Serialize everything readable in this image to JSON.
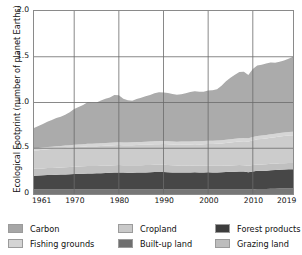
{
  "chart_data": {
    "type": "area",
    "stacked": true,
    "title": "",
    "subtitle": "",
    "xlabel": "",
    "ylabel": "Ecological Footprint (number of planet Earths)",
    "xlim": [
      1961,
      2019
    ],
    "ylim": [
      0,
      2.0
    ],
    "grid": true,
    "legend_position": "bottom",
    "xticks": [
      "1961",
      "1970",
      "1980",
      "1990",
      "2000",
      "2010",
      "2019"
    ],
    "xtick_values": [
      1961,
      1970,
      1980,
      1990,
      2000,
      2010,
      2019
    ],
    "yticks": [
      "0",
      "0.5",
      "1.0",
      "1.5",
      "2.0"
    ],
    "ytick_values": [
      0,
      0.5,
      1.0,
      1.5,
      2.0
    ],
    "x": [
      1961,
      1962,
      1963,
      1964,
      1965,
      1966,
      1967,
      1968,
      1969,
      1970,
      1971,
      1972,
      1973,
      1974,
      1975,
      1976,
      1977,
      1978,
      1979,
      1980,
      1981,
      1982,
      1983,
      1984,
      1985,
      1986,
      1987,
      1988,
      1989,
      1990,
      1991,
      1992,
      1993,
      1994,
      1995,
      1996,
      1997,
      1998,
      1999,
      2000,
      2001,
      2002,
      2003,
      2004,
      2005,
      2006,
      2007,
      2008,
      2009,
      2010,
      2011,
      2012,
      2013,
      2014,
      2015,
      2016,
      2017,
      2018,
      2019
    ],
    "series": [
      {
        "name": "Built-up land",
        "color": "#6f6f6f",
        "values": [
          0.05,
          0.05,
          0.05,
          0.05,
          0.05,
          0.05,
          0.05,
          0.05,
          0.05,
          0.05,
          0.05,
          0.05,
          0.05,
          0.05,
          0.05,
          0.05,
          0.05,
          0.05,
          0.05,
          0.05,
          0.05,
          0.05,
          0.05,
          0.05,
          0.05,
          0.05,
          0.05,
          0.05,
          0.05,
          0.05,
          0.05,
          0.05,
          0.05,
          0.05,
          0.05,
          0.05,
          0.05,
          0.05,
          0.05,
          0.05,
          0.05,
          0.05,
          0.05,
          0.05,
          0.05,
          0.05,
          0.05,
          0.05,
          0.05,
          0.05,
          0.055,
          0.055,
          0.055,
          0.058,
          0.058,
          0.06,
          0.06,
          0.06,
          0.06
        ]
      },
      {
        "name": "Forest products",
        "color": "#3d3d3d",
        "values": [
          0.15,
          0.152,
          0.154,
          0.157,
          0.158,
          0.16,
          0.162,
          0.164,
          0.166,
          0.168,
          0.17,
          0.172,
          0.175,
          0.175,
          0.176,
          0.178,
          0.18,
          0.182,
          0.184,
          0.186,
          0.184,
          0.183,
          0.183,
          0.184,
          0.185,
          0.186,
          0.188,
          0.19,
          0.19,
          0.19,
          0.188,
          0.186,
          0.185,
          0.185,
          0.186,
          0.186,
          0.187,
          0.186,
          0.186,
          0.188,
          0.186,
          0.186,
          0.187,
          0.19,
          0.192,
          0.194,
          0.196,
          0.195,
          0.188,
          0.196,
          0.198,
          0.198,
          0.2,
          0.202,
          0.203,
          0.205,
          0.207,
          0.21,
          0.21
        ]
      },
      {
        "name": "Grazing land",
        "color": "#bdbdbd",
        "values": [
          0.075,
          0.075,
          0.076,
          0.076,
          0.077,
          0.077,
          0.078,
          0.078,
          0.079,
          0.079,
          0.08,
          0.08,
          0.08,
          0.08,
          0.08,
          0.08,
          0.08,
          0.08,
          0.08,
          0.08,
          0.08,
          0.08,
          0.08,
          0.08,
          0.08,
          0.08,
          0.08,
          0.08,
          0.08,
          0.08,
          0.08,
          0.078,
          0.076,
          0.075,
          0.075,
          0.074,
          0.074,
          0.073,
          0.073,
          0.072,
          0.072,
          0.072,
          0.071,
          0.071,
          0.07,
          0.07,
          0.07,
          0.07,
          0.07,
          0.07,
          0.07,
          0.07,
          0.07,
          0.07,
          0.07,
          0.07,
          0.07,
          0.07,
          0.07
        ]
      },
      {
        "name": "Cropland",
        "color": "#c9c9c9",
        "values": [
          0.2,
          0.202,
          0.204,
          0.206,
          0.208,
          0.21,
          0.21,
          0.212,
          0.212,
          0.214,
          0.214,
          0.215,
          0.216,
          0.216,
          0.217,
          0.217,
          0.218,
          0.218,
          0.219,
          0.22,
          0.22,
          0.221,
          0.221,
          0.222,
          0.222,
          0.223,
          0.224,
          0.224,
          0.225,
          0.226,
          0.226,
          0.227,
          0.228,
          0.229,
          0.23,
          0.231,
          0.232,
          0.233,
          0.235,
          0.237,
          0.239,
          0.241,
          0.244,
          0.247,
          0.25,
          0.254,
          0.258,
          0.262,
          0.266,
          0.27,
          0.274,
          0.278,
          0.282,
          0.286,
          0.29,
          0.294,
          0.297,
          0.3,
          0.302
        ]
      },
      {
        "name": "Fishing grounds",
        "color": "#d4d4d4",
        "values": [
          0.022,
          0.023,
          0.023,
          0.024,
          0.024,
          0.025,
          0.025,
          0.026,
          0.026,
          0.027,
          0.027,
          0.027,
          0.028,
          0.028,
          0.028,
          0.029,
          0.029,
          0.029,
          0.03,
          0.03,
          0.03,
          0.03,
          0.031,
          0.031,
          0.031,
          0.032,
          0.032,
          0.032,
          0.033,
          0.033,
          0.033,
          0.033,
          0.033,
          0.034,
          0.034,
          0.034,
          0.034,
          0.034,
          0.035,
          0.035,
          0.035,
          0.035,
          0.035,
          0.036,
          0.036,
          0.036,
          0.036,
          0.036,
          0.036,
          0.037,
          0.037,
          0.037,
          0.037,
          0.037,
          0.038,
          0.038,
          0.038,
          0.038,
          0.038
        ]
      },
      {
        "name": "Carbon",
        "color": "#a6a6a6",
        "values": [
          0.225,
          0.24,
          0.258,
          0.276,
          0.291,
          0.309,
          0.318,
          0.336,
          0.36,
          0.392,
          0.41,
          0.428,
          0.455,
          0.45,
          0.448,
          0.468,
          0.485,
          0.495,
          0.52,
          0.514,
          0.478,
          0.461,
          0.455,
          0.47,
          0.484,
          0.496,
          0.507,
          0.526,
          0.534,
          0.531,
          0.528,
          0.52,
          0.513,
          0.516,
          0.526,
          0.54,
          0.546,
          0.541,
          0.538,
          0.549,
          0.552,
          0.56,
          0.596,
          0.637,
          0.672,
          0.7,
          0.724,
          0.722,
          0.691,
          0.742,
          0.771,
          0.775,
          0.781,
          0.784,
          0.776,
          0.777,
          0.786,
          0.8,
          0.82
        ]
      }
    ],
    "totals_note": "Stacked total rises from about 0.72 planet Earths in 1961 to about 1.72 planet Earths in 2019."
  },
  "axis": {
    "ylabel": "Ecological Footprint (number of planet Earths)",
    "yticks": [
      {
        "label": "2.0",
        "value": 2.0
      },
      {
        "label": "1.5",
        "value": 1.5
      },
      {
        "label": "1.0",
        "value": 1.0
      },
      {
        "label": "0.5",
        "value": 0.5
      },
      {
        "label": "0",
        "value": 0
      }
    ],
    "xticks": [
      {
        "label": "1961",
        "value": 1961
      },
      {
        "label": "1970",
        "value": 1970
      },
      {
        "label": "1980",
        "value": 1980
      },
      {
        "label": "1990",
        "value": 1990
      },
      {
        "label": "2000",
        "value": 2000
      },
      {
        "label": "2010",
        "value": 2010
      },
      {
        "label": "2019",
        "value": 2019
      }
    ]
  },
  "legend": {
    "rows": [
      [
        {
          "label": "Carbon",
          "color": "#a6a6a6"
        },
        {
          "label": "Cropland",
          "color": "#c9c9c9"
        },
        {
          "label": "Forest products",
          "color": "#3d3d3d"
        }
      ],
      [
        {
          "label": "Fishing grounds",
          "color": "#d4d4d4"
        },
        {
          "label": "Built-up land",
          "color": "#6f6f6f"
        },
        {
          "label": "Grazing land",
          "color": "#bdbdbd"
        }
      ]
    ]
  },
  "colors": {
    "grid": "#6b6b6b",
    "frame": "#8a8a8a",
    "background": "#ffffff",
    "text": "#111111"
  }
}
